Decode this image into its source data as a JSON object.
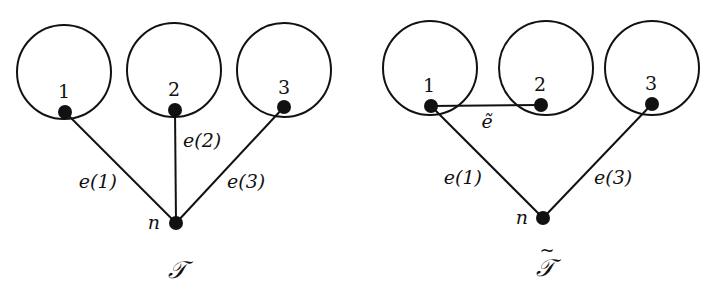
{
  "style": {
    "stroke_color": "#111111",
    "background": "#ffffff",
    "circle_radius": 47,
    "node_radius": 7,
    "stroke_width": 2
  },
  "diagrams": [
    {
      "id": "T",
      "caption": "𝒯",
      "circles": [
        {
          "label": "1",
          "cx": 64,
          "cy": 72,
          "node": {
            "x": 65,
            "y": 112
          }
        },
        {
          "label": "2",
          "cx": 174,
          "cy": 70,
          "node": {
            "x": 175,
            "y": 110
          }
        },
        {
          "label": "3",
          "cx": 284,
          "cy": 70,
          "node": {
            "x": 284,
            "y": 107
          }
        }
      ],
      "root": {
        "label": "n",
        "x": 176,
        "y": 223
      },
      "edges": [
        {
          "label": "e(1)",
          "from": "1",
          "to": "n"
        },
        {
          "label": "e(2)",
          "from": "2",
          "to": "n"
        },
        {
          "label": "e(3)",
          "from": "3",
          "to": "n"
        }
      ]
    },
    {
      "id": "T-tilde",
      "caption": "𝒯̃",
      "circles": [
        {
          "label": "1",
          "cx": 430,
          "cy": 68,
          "node": {
            "x": 431,
            "y": 106
          }
        },
        {
          "label": "2",
          "cx": 546,
          "cy": 68,
          "node": {
            "x": 541,
            "y": 105
          }
        },
        {
          "label": "3",
          "cx": 652,
          "cy": 68,
          "node": {
            "x": 652,
            "y": 104
          }
        }
      ],
      "root": {
        "label": "n",
        "x": 543,
        "y": 218
      },
      "edges": [
        {
          "label": "e(1)",
          "from": "1",
          "to": "n"
        },
        {
          "label": "e(3)",
          "from": "3",
          "to": "n"
        },
        {
          "label": "ẽ",
          "from": "1",
          "to": "2"
        }
      ]
    }
  ],
  "labels": {
    "left": {
      "node1": "1",
      "node2": "2",
      "node3": "3",
      "root": "n",
      "e1": "e(1)",
      "e2": "e(2)",
      "e3": "e(3)",
      "caption": "𝒯"
    },
    "right": {
      "node1": "1",
      "node2": "2",
      "node3": "3",
      "root": "n",
      "e1": "e(1)",
      "e3": "e(3)",
      "etilde": "ẽ",
      "caption": "𝒯"
    }
  }
}
